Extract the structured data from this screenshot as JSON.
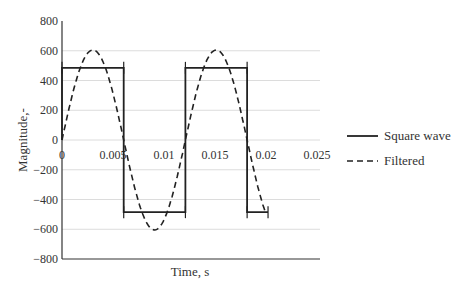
{
  "chart_data": {
    "type": "line",
    "title": "",
    "xlabel": "Time, s",
    "ylabel": "Magnitude,-",
    "xlim": [
      0,
      0.025
    ],
    "ylim": [
      -800,
      800
    ],
    "x_ticks": [
      "0",
      "0.005",
      "0.01",
      "0.015",
      "0.02",
      "0.025"
    ],
    "y_ticks": [
      "800",
      "600",
      "400",
      "200",
      "0",
      "−200",
      "−400",
      "−600",
      "−800"
    ],
    "grid": true,
    "legend_position": "right",
    "series": [
      {
        "name": "Square wave",
        "style": "solid",
        "color": "#222222",
        "amplitude": 485,
        "period": 0.0121,
        "x": [
          0,
          0,
          0.00605,
          0.00605,
          0.0121,
          0.0121,
          0.01815,
          0.01815,
          0.0202
        ],
        "y": [
          0,
          485,
          485,
          -485,
          -485,
          485,
          485,
          -485,
          -485
        ]
      },
      {
        "name": "Filtered",
        "style": "dashed",
        "color": "#222222",
        "amplitude": 605,
        "period": 0.0121,
        "x": [
          0,
          0.001,
          0.002,
          0.003,
          0.004,
          0.005,
          0.006,
          0.007,
          0.008,
          0.009,
          0.01,
          0.011,
          0.012,
          0.013,
          0.014,
          0.015,
          0.016,
          0.017,
          0.018,
          0.019,
          0.02
        ],
        "y": [
          0,
          304,
          523,
          605,
          520,
          299,
          -7,
          -310,
          -525,
          -605,
          -518,
          -293,
          16,
          317,
          530,
          604,
          514,
          286,
          -22,
          -323,
          -532
        ]
      }
    ]
  },
  "legend": {
    "items": [
      {
        "label": "Square wave",
        "style": "solid"
      },
      {
        "label": "Filtered",
        "style": "dashed"
      }
    ]
  }
}
